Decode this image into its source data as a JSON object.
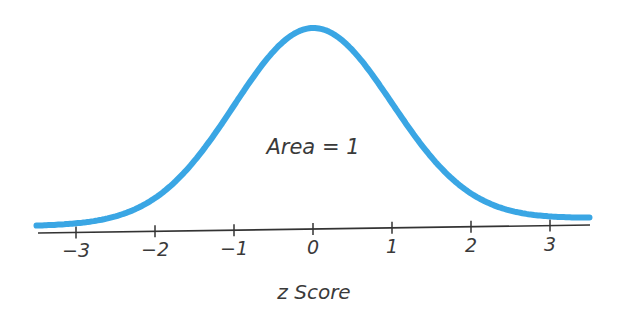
{
  "chart_data": {
    "type": "line",
    "title": "",
    "subtitle": "",
    "xlabel": "z Score",
    "ylabel": "",
    "xlim": [
      -3.5,
      3.5
    ],
    "grid": false,
    "legend": null,
    "annotations": [
      {
        "text": "Area = 1",
        "x": 0,
        "position": "under curve center"
      }
    ],
    "x_ticks": [
      -3,
      -2,
      -1,
      0,
      1,
      2,
      3
    ],
    "x_tick_labels": [
      "−3",
      "−2",
      "−1",
      "0",
      "1",
      "2",
      "3"
    ],
    "series": [
      {
        "name": "Standard normal density",
        "distribution": "normal",
        "mean": 0,
        "std": 1,
        "x": [
          -3.5,
          -3,
          -2.5,
          -2,
          -1.5,
          -1,
          -0.5,
          0,
          0.5,
          1,
          1.5,
          2,
          2.5,
          3,
          3.5
        ],
        "values": [
          0.0009,
          0.0044,
          0.0175,
          0.054,
          0.1295,
          0.242,
          0.3521,
          0.3989,
          0.3521,
          0.242,
          0.1295,
          0.054,
          0.0175,
          0.0044,
          0.0009
        ]
      }
    ],
    "colors": {
      "curve": "#3aa6e4",
      "axis": "#333333",
      "text": "#3a3a3a"
    }
  },
  "labels": {
    "area": "Area = 1",
    "xlabel": "z Score",
    "ticks": [
      "−3",
      "−2",
      "−1",
      "0",
      "1",
      "2",
      "3"
    ]
  }
}
